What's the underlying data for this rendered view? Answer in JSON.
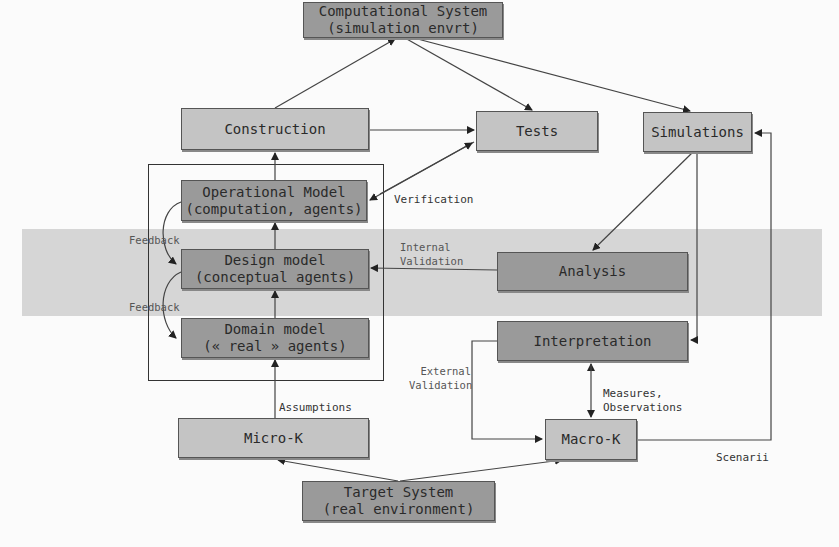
{
  "diagram": {
    "nodes": {
      "computational_system": {
        "line1": "Computational System",
        "line2": "(simulation envrt)"
      },
      "construction": {
        "line1": "Construction"
      },
      "tests": {
        "line1": "Tests"
      },
      "simulations": {
        "line1": "Simulations"
      },
      "operational_model": {
        "line1": "Operational Model",
        "line2": "(computation, agents)"
      },
      "design_model": {
        "line1": "Design model",
        "line2": "(conceptual agents)"
      },
      "domain_model": {
        "line1": "Domain model",
        "line2": "(« real » agents)"
      },
      "analysis": {
        "line1": "Analysis"
      },
      "interpretation": {
        "line1": "Interpretation"
      },
      "micro_k": {
        "line1": "Micro-K"
      },
      "macro_k": {
        "line1": "Macro-K"
      },
      "target_system": {
        "line1": "Target System",
        "line2": "(real environment)"
      }
    },
    "edge_labels": {
      "verification": "Verification",
      "internal_validation_1": "Internal",
      "internal_validation_2": "Validation",
      "external_validation_1": "External",
      "external_validation_2": "Validation",
      "feedback_upper": "Feedback",
      "feedback_lower": "Feedback",
      "assumptions": "Assumptions",
      "measures_1": "Measures,",
      "measures_2": "Observations",
      "scenarii": "Scenarii"
    },
    "colors": {
      "light_box": "#c4c4c4",
      "dark_box": "#9a9a9a",
      "band": "#d6d6d6",
      "line": "#333333"
    }
  }
}
